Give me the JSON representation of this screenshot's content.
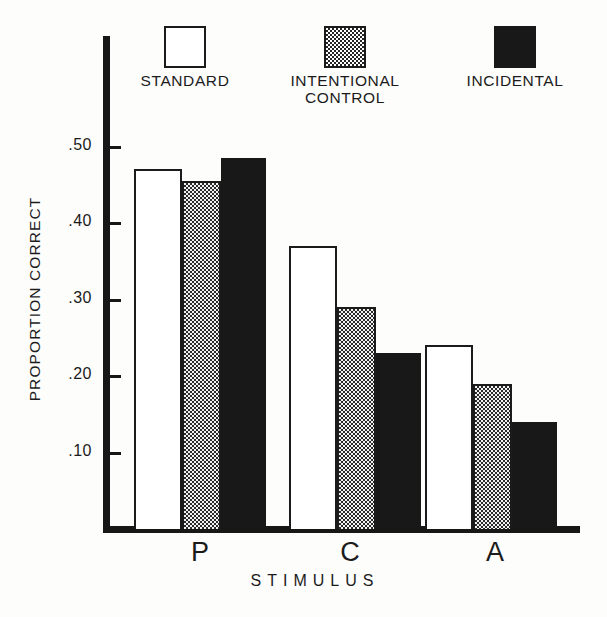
{
  "chart_data": {
    "type": "bar",
    "title": "",
    "xlabel": "STIMULUS",
    "ylabel": "PROPORTION CORRECT",
    "categories": [
      "P",
      "C",
      "A"
    ],
    "series": [
      {
        "name": "STANDARD",
        "swatch": "open",
        "values": [
          0.47,
          0.37,
          0.24
        ]
      },
      {
        "name": "INTENTIONAL\nCONTROL",
        "swatch": "checkered",
        "values": [
          0.455,
          0.29,
          0.19
        ]
      },
      {
        "name": "INCIDENTAL",
        "swatch": "solid",
        "values": [
          0.485,
          0.23,
          0.14
        ]
      }
    ],
    "ylim": [
      0.0,
      0.56
    ],
    "yticks": [
      0.5,
      0.4,
      0.3,
      0.2,
      0.1
    ],
    "ytick_labels": [
      ".50",
      ".40",
      ".30",
      ".20",
      ".10"
    ],
    "grid": false,
    "legend_position": "top"
  },
  "legend": {
    "entries": [
      {
        "label": "STANDARD",
        "swatch": "open"
      },
      {
        "label": "INTENTIONAL\nCONTROL",
        "swatch": "checkered"
      },
      {
        "label": "INCIDENTAL",
        "swatch": "solid"
      }
    ]
  },
  "axes": {
    "y_title": "PROPORTION  CORRECT",
    "x_title": "STIMULUS",
    "y_tick_labels": [
      ".50",
      ".40",
      ".30",
      ".20",
      ".10"
    ],
    "x_group_labels": [
      "P",
      "C",
      "A"
    ]
  },
  "colors": {
    "ink": "#171717",
    "open_fill": "#ffffff",
    "checker_fill": "#2a2a2a",
    "solid_fill": "#181818",
    "background": "#fdfdfc"
  }
}
